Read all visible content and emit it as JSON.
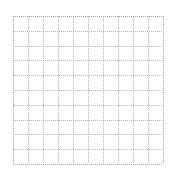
{
  "canvas": {
    "width": 172,
    "height": 173,
    "background_color": "#ffffff"
  },
  "grid": {
    "title": "",
    "origin_x": 13,
    "origin_y": 16,
    "width": 150,
    "height": 148,
    "columns": 10,
    "rows": 10,
    "cell_width": 15,
    "cell_height": 14.8,
    "line_color": "#9a9a9a",
    "line_style": "dotted",
    "line_width": 1,
    "vertical_positions": [
      0,
      15,
      30,
      45,
      60,
      75,
      90,
      105,
      120,
      135,
      150
    ],
    "horizontal_positions": [
      0,
      14.8,
      29.6,
      44.4,
      59.2,
      74,
      88.8,
      103.6,
      118.4,
      133.2,
      148
    ]
  },
  "chart_data": {
    "type": "table",
    "title": "",
    "subtitle": "",
    "xlabel": "",
    "ylabel": "",
    "categories": [],
    "values": [],
    "grid": true,
    "legend": "none",
    "xlim": [
      0,
      10
    ],
    "ylim": [
      0,
      10
    ],
    "xticks": [
      0,
      1,
      2,
      3,
      4,
      5,
      6,
      7,
      8,
      9,
      10
    ],
    "yticks": [
      0,
      1,
      2,
      3,
      4,
      5,
      6,
      7,
      8,
      9,
      10
    ],
    "xticklabels": [
      "",
      "",
      "",
      "",
      "",
      "",
      "",
      "",
      "",
      "",
      ""
    ],
    "yticklabels": [
      "",
      "",
      "",
      "",
      "",
      "",
      "",
      "",
      "",
      "",
      ""
    ],
    "annotations": [],
    "series": []
  }
}
